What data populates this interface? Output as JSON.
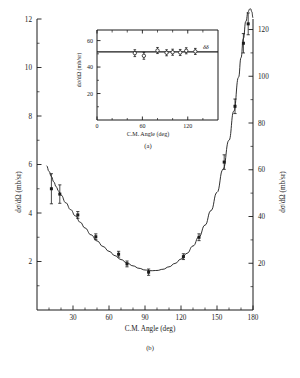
{
  "figure": {
    "panels": [
      "(a)",
      "(b)"
    ],
    "background": "#ffffff",
    "ink": "#1a1a1a"
  },
  "chart_data": [
    {
      "id": "main",
      "type": "line",
      "panel_label": "(b)",
      "title": "",
      "xlabel": "C.M. Angle (deg)",
      "ylabel": "dσ/dΩ (mb/sr)",
      "ylabel_right": "dσ/dΩ (mb/sr)",
      "xlim": [
        0,
        180
      ],
      "ylim": [
        0,
        12
      ],
      "ylim_right": [
        0,
        124.5
      ],
      "xticks": [
        30,
        60,
        90,
        120,
        150,
        180
      ],
      "xticks_minor": [
        10,
        20,
        40,
        50,
        70,
        80,
        100,
        110,
        130,
        140,
        160,
        170
      ],
      "yticks": [
        2,
        4,
        6,
        8,
        10,
        12
      ],
      "yticks_minor": [
        1,
        3,
        5,
        7,
        9,
        11
      ],
      "yticks_right": [
        20,
        40,
        60,
        80,
        100,
        120
      ],
      "yticks_right_minor": [
        10,
        30,
        50,
        70,
        90,
        110
      ],
      "grid": false,
      "legend": false,
      "marker": "filled-square",
      "series": [
        {
          "name": "fit curve",
          "x": [
            8,
            10,
            12,
            14,
            16,
            18,
            20,
            24,
            28,
            32,
            36,
            40,
            45,
            50,
            55,
            60,
            65,
            70,
            75,
            80,
            85,
            90,
            95,
            100,
            105,
            110,
            115,
            120,
            125,
            130,
            135,
            140,
            145,
            150,
            155,
            160,
            164,
            168,
            170,
            172,
            174,
            176,
            177,
            178,
            179,
            180
          ],
          "y": [
            5.95,
            5.72,
            5.5,
            5.28,
            5.08,
            4.9,
            4.74,
            4.42,
            4.14,
            3.88,
            3.62,
            3.38,
            3.1,
            2.85,
            2.62,
            2.42,
            2.24,
            2.08,
            1.94,
            1.82,
            1.72,
            1.65,
            1.62,
            1.63,
            1.68,
            1.78,
            1.92,
            2.1,
            2.34,
            2.64,
            3.02,
            3.5,
            4.1,
            4.85,
            5.8,
            7.0,
            8.2,
            9.6,
            10.4,
            11.2,
            11.9,
            12.3,
            12.4,
            12.42,
            12.3,
            12.05
          ]
        }
      ],
      "points": [
        {
          "x": 12,
          "y": 5.0,
          "yerr": 0.62
        },
        {
          "x": 19,
          "y": 4.78,
          "yerr": 0.38
        },
        {
          "x": 34,
          "y": 3.92,
          "yerr": 0.14
        },
        {
          "x": 49,
          "y": 3.02,
          "yerr": 0.12
        },
        {
          "x": 68,
          "y": 2.3,
          "yerr": 0.12
        },
        {
          "x": 75,
          "y": 1.9,
          "yerr": 0.12
        },
        {
          "x": 93,
          "y": 1.56,
          "yerr": 0.13
        },
        {
          "x": 122,
          "y": 2.2,
          "yerr": 0.12
        },
        {
          "x": 135,
          "y": 3.0,
          "yerr": 0.14
        },
        {
          "x": 156,
          "y": 6.1,
          "yerr": 0.3
        },
        {
          "x": 165,
          "y": 8.4,
          "yerr": 0.3
        },
        {
          "x": 172,
          "y": 11.0,
          "yerr": 0.4
        },
        {
          "x": 176,
          "y": 11.8,
          "yerr": 0.45
        }
      ]
    },
    {
      "id": "inset",
      "type": "scatter",
      "panel_label": "(a)",
      "title": "",
      "xlabel": "C.M. Angle (deg)",
      "ylabel": "dσ/dΩ (mb/sr)",
      "xlim": [
        0,
        160
      ],
      "ylim": [
        0,
        68
      ],
      "xticks": [
        0,
        60,
        120
      ],
      "xticks_minor": [
        20,
        40,
        80,
        100,
        140
      ],
      "yticks": [
        20,
        40,
        60
      ],
      "yticks_minor": [
        10,
        30,
        50
      ],
      "grid": false,
      "legend": false,
      "marker": "open-circle",
      "annotation": "δδ",
      "annotation_x": 140,
      "annotation_y": 53.5,
      "fit_line": {
        "y": 51.5,
        "x0": 0,
        "x1": 160
      },
      "points": [
        {
          "x": 50,
          "y": 50.5,
          "yerr": 2.6
        },
        {
          "x": 62,
          "y": 48.5,
          "yerr": 2.6
        },
        {
          "x": 80,
          "y": 52.5,
          "yerr": 2.3
        },
        {
          "x": 92,
          "y": 50.8,
          "yerr": 2.3
        },
        {
          "x": 100,
          "y": 51.2,
          "yerr": 2.3
        },
        {
          "x": 110,
          "y": 51.0,
          "yerr": 2.3
        },
        {
          "x": 118,
          "y": 52.3,
          "yerr": 2.3
        },
        {
          "x": 130,
          "y": 51.8,
          "yerr": 2.3
        }
      ]
    }
  ]
}
